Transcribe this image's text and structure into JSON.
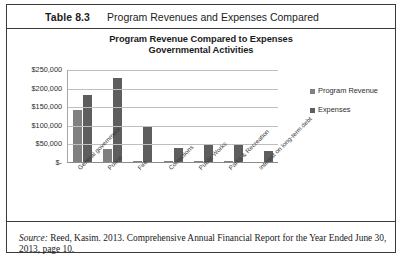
{
  "table": {
    "label": "Table 8.3",
    "caption": "Program Revenues and Expenses Compared"
  },
  "chart_data": {
    "type": "bar",
    "title": "Program Revenue Compared to Expenses",
    "subtitle": "Governmental Activities",
    "xlabel": "",
    "ylabel": "",
    "ylim": [
      0,
      250000
    ],
    "yticks": [
      0,
      50000,
      100000,
      150000,
      200000,
      250000
    ],
    "ytick_labels": [
      "$-",
      "$50,000",
      "$100,000",
      "$150,000",
      "$200,000",
      "$250,000"
    ],
    "grid": true,
    "legend_position": "right",
    "categories": [
      "General government",
      "Police",
      "Fire",
      "Corrections",
      "Public Works",
      "Parks & Recreation",
      "Interest on long-term debt"
    ],
    "series": [
      {
        "name": "Program Revenue",
        "color": "#808080",
        "values": [
          140000,
          35000,
          4000,
          2000,
          4000,
          4000,
          0
        ]
      },
      {
        "name": "Expenses",
        "color": "#5e5e5e",
        "values": [
          180000,
          225000,
          97000,
          38000,
          48000,
          48000,
          30000
        ]
      }
    ]
  },
  "legend": {
    "items": [
      {
        "label": "Program Revenue",
        "color": "#808080"
      },
      {
        "label": "Expenses",
        "color": "#5e5e5e"
      }
    ]
  },
  "source": {
    "prefix": "Source:",
    "text": "Reed, Kasim. 2013. Comprehensive Annual Financial Report for the Year Ended June 30, 2013, page 10."
  }
}
